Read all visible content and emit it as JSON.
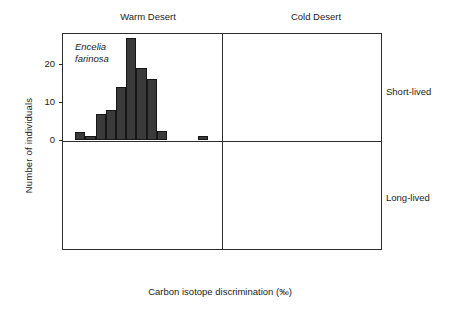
{
  "chart_data": {
    "type": "bar",
    "title": "",
    "xlabel": "Carbon isotope discrimination (‰)",
    "ylabel": "Number of individuals",
    "ylim": [
      0,
      28
    ],
    "yticks": [
      0,
      10,
      20
    ],
    "grid": false,
    "legend": "none",
    "column_headers": [
      "Warm Desert",
      "Cold Desert"
    ],
    "row_headers": [
      "Short-lived",
      "Long-lived"
    ],
    "bin_width": 0.5,
    "panels": [
      {
        "id": "encelia",
        "species": "Encelia farinosa",
        "species_line1": "Encelia",
        "species_line2": "farinosa",
        "column": "Warm Desert",
        "row": "Short-lived",
        "xlim": [
          13.6,
          21.4
        ],
        "xticks": [
          14,
          16,
          18,
          20
        ],
        "xticklabels": [
          "14",
          "16",
          "18",
          "20"
        ],
        "bins": [
          14.2,
          14.7,
          15.2,
          15.7,
          16.2,
          16.7,
          17.2,
          17.7,
          18.2,
          18.7,
          20.2
        ],
        "values": [
          2,
          1,
          7,
          8,
          14,
          27,
          19,
          16,
          2.5,
          0,
          1
        ]
      },
      {
        "id": "gutierrezia",
        "species": "Gutierrezia microcephala",
        "species_line1": "Gutierrezia",
        "species_line2": "microcephala",
        "column": "Cold Desert",
        "row": "Short-lived",
        "xlim": [
          13.6,
          21.4
        ],
        "xticks": [
          14,
          16,
          18,
          20
        ],
        "xticklabels": [
          "14",
          "16",
          "18",
          "20"
        ],
        "bins": [
          14.7,
          15.2,
          15.7,
          16.2,
          16.7,
          17.2,
          17.7,
          18.2,
          18.7,
          19.2,
          19.7
        ],
        "values": [
          0.5,
          1.5,
          1.5,
          3.5,
          3.5,
          21,
          16.5,
          19,
          9.5,
          7,
          2
        ]
      },
      {
        "id": "larrea",
        "species": "Larrea tridentata",
        "species_line1": "Larrea",
        "species_line2": "tridentata",
        "column": "Warm Desert",
        "row": "Long-lived",
        "xlim": [
          13.6,
          21.4
        ],
        "xticks": [
          14,
          16,
          18,
          20
        ],
        "xticklabels": [
          "14",
          "16",
          "18",
          "20"
        ],
        "bins": [
          14.0,
          14.5,
          15.0,
          15.5,
          16.0,
          16.5
        ],
        "values": [
          7,
          24.5,
          16,
          7,
          3,
          1
        ]
      },
      {
        "id": "coleogyne",
        "species": "Coleogyne ramosissima",
        "species_line1": "Coleogyne",
        "species_line2": "ramosissima",
        "column": "Cold Desert",
        "row": "Long-lived",
        "xlim": [
          13.6,
          21.4
        ],
        "xticks": [
          14,
          16,
          18,
          20
        ],
        "xticklabels": [
          "14",
          "16",
          "18",
          "20"
        ],
        "bins": [
          15.5,
          16.0,
          16.5,
          17.0,
          17.5,
          18.0,
          18.5
        ],
        "values": [
          3.5,
          21.5,
          18,
          26.5,
          19,
          8,
          3.5
        ]
      }
    ],
    "colors": {
      "bar_fill": "#3a3a3a",
      "bar_edge": "#161616",
      "axis": "#2b2b2b",
      "text": "#1c1c1c",
      "background": "#ffffff"
    }
  }
}
